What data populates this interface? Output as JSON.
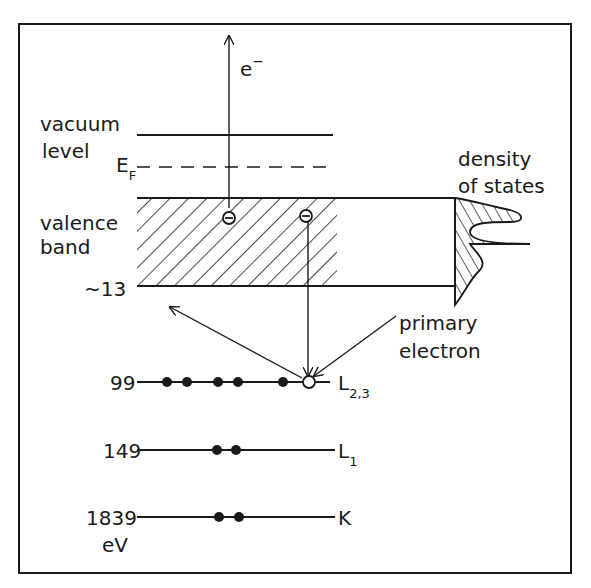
{
  "diagram": {
    "colors": {
      "ink": "#1a1a1a",
      "background": "#ffffff"
    },
    "labels": {
      "emitted_electron": "e",
      "emitted_electron_sup": "−",
      "vacuum_line1": "vacuum",
      "vacuum_line2": "level",
      "fermi": "E",
      "fermi_sub": "F",
      "valence_line1": "valence",
      "valence_line2": "band",
      "dos_line1": "density",
      "dos_line2": "of states",
      "primary_line1": "primary",
      "primary_line2": "electron",
      "units": "eV"
    },
    "levels": [
      {
        "energy": "~13",
        "name": "valence band bottom"
      },
      {
        "energy": "99",
        "name": "L",
        "sub": "2,3",
        "filled_electrons": 5,
        "holes": 1
      },
      {
        "energy": "149",
        "name": "L",
        "sub": "1",
        "filled_electrons": 2
      },
      {
        "energy": "1839",
        "name": "K",
        "filled_electrons": 2
      }
    ],
    "valence_electrons": [
      "−",
      "−"
    ]
  }
}
